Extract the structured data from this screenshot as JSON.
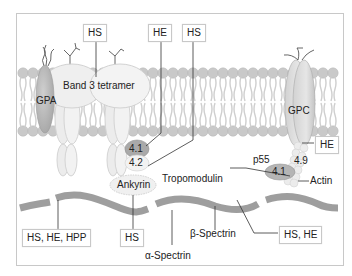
{
  "colors": {
    "frame": "#c8c8c8",
    "lipid_head": "#c9c9c9",
    "lipid_tail": "#cfcfcf",
    "protein_light": "#ececec",
    "protein_mid": "#d6d6d6",
    "protein_dark": "#a9a9a9",
    "spectrin": "#9e9e9e",
    "line": "#333333"
  },
  "proteins": {
    "gpa": "GPA",
    "band3": "Band 3 tetramer",
    "gpc": "GPC",
    "p41_left": "4.1",
    "p42": "4.2",
    "ankyrin": "Ankyrin",
    "p55": "p55",
    "p41_right": "4.1",
    "p49": "4.9",
    "tropomodulin": "Tropomodulin",
    "actin": "Actin",
    "beta_spectrin": "β-Spectrin",
    "alpha_spectrin": "α-Spectrin"
  },
  "disease_boxes": {
    "hs_band3": "HS",
    "he_41": "HE",
    "hs_42": "HS",
    "he_gpc": "HE",
    "spectrin_left": "HS, HE, HPP",
    "hs_ankyrin": "HS",
    "spectrin_right": "HS, HE"
  }
}
